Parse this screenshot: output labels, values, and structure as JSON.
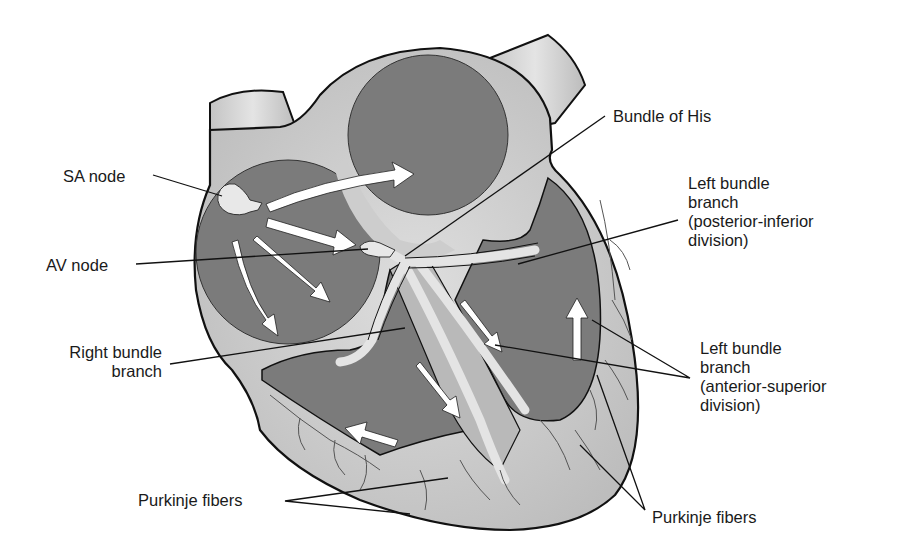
{
  "diagram": {
    "type": "anatomical-illustration",
    "colors": {
      "background": "#ffffff",
      "chamber_fill": "#7b7b7b",
      "wall_fill": "#cdcdcd",
      "vessel_fill": "#d8d8d8",
      "conduction_fill": "#e2e2e2",
      "outline": "#111111",
      "arrow_fill": "#ffffff",
      "leader_line": "#111111"
    },
    "labels": {
      "sa_node": "SA node",
      "av_node": "AV node",
      "bundle_of_his": "Bundle of His",
      "left_bundle_posterior": [
        "Left bundle",
        "branch",
        "(posterior-inferior",
        "division)"
      ],
      "right_bundle": [
        "Right bundle",
        "branch"
      ],
      "left_bundle_anterior": [
        "Left bundle",
        "branch",
        "(anterior-superior",
        "division)"
      ],
      "purkinje_left": "Purkinje fibers",
      "purkinje_right": "Purkinje fibers"
    }
  }
}
